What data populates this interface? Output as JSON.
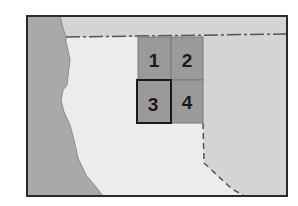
{
  "map": {
    "colors": {
      "background": "#ffffff",
      "land_outside": "#a9a9a9",
      "land_neighbor": "#d4d4d4",
      "land_region": "#ececec",
      "grid_fill": "#9a9a9a",
      "grid_lines": "#7a7a7a",
      "frame": "#2a2a2a",
      "boundary": "#555555"
    },
    "grid": {
      "cells": [
        {
          "id": 1,
          "label": "1",
          "highlighted": false
        },
        {
          "id": 2,
          "label": "2",
          "highlighted": false
        },
        {
          "id": 3,
          "label": "3",
          "highlighted": true
        },
        {
          "id": 4,
          "label": "4",
          "highlighted": false
        }
      ]
    }
  }
}
